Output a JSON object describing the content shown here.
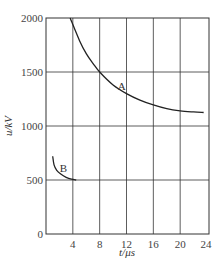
{
  "chart_data": {
    "type": "line",
    "title": "",
    "xlabel": "t/μs",
    "ylabel": "u/kV",
    "xlim": [
      0,
      24
    ],
    "ylim": [
      0,
      2000
    ],
    "xticks": [
      4,
      8,
      12,
      16,
      20,
      24
    ],
    "yticks": [
      0,
      500,
      1000,
      1500,
      2000
    ],
    "origin_label": "0",
    "grid": true,
    "series": [
      {
        "name": "A",
        "x": [
          3.6,
          5,
          6,
          7,
          8,
          10,
          12,
          14,
          16,
          18,
          20,
          22,
          23.5
        ],
        "y": [
          2000,
          1790,
          1670,
          1580,
          1500,
          1380,
          1300,
          1240,
          1195,
          1160,
          1140,
          1130,
          1125
        ]
      },
      {
        "name": "B",
        "x": [
          1.0,
          1.2,
          1.6,
          2.2,
          3.0,
          3.8,
          4.5
        ],
        "y": [
          720,
          640,
          590,
          555,
          525,
          507,
          500
        ]
      }
    ],
    "annotations": [
      {
        "text": "A",
        "x": 11.3,
        "y": 1330
      },
      {
        "text": "B",
        "x": 2.6,
        "y": 575
      }
    ]
  }
}
